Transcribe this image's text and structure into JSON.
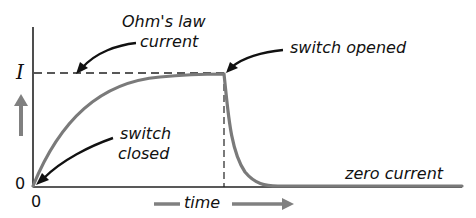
{
  "diagram": {
    "labels": {
      "ohms_law_line1": "Ohm's law",
      "ohms_law_line2": "current",
      "switch_opened": "switch opened",
      "switch_closed_line1": "switch",
      "switch_closed_line2": "closed",
      "zero_current": "zero current",
      "time": "time",
      "y_level_I": "I",
      "y_origin": "0",
      "x_origin": "0"
    },
    "colors": {
      "axis": "#222222",
      "curve": "#7a7a7a",
      "arrow_gray": "#808080",
      "text": "#111111"
    }
  }
}
